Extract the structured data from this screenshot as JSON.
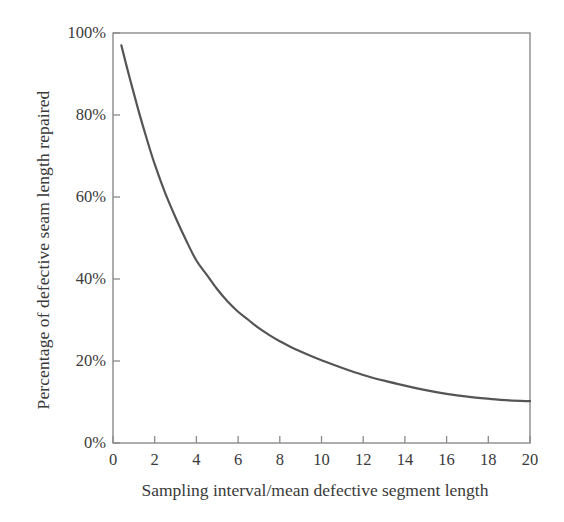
{
  "chart_data": {
    "type": "line",
    "title": "",
    "xlabel": "Sampling interval/mean defective segment length",
    "ylabel": "Percentage of defective seam length repaired",
    "xlim": [
      0,
      20
    ],
    "ylim": [
      0,
      100
    ],
    "grid": false,
    "legend": null,
    "xticks": [
      0,
      2,
      4,
      6,
      8,
      10,
      12,
      14,
      16,
      18,
      20
    ],
    "xtick_labels": [
      "0",
      "2",
      "4",
      "6",
      "8",
      "10",
      "12",
      "14",
      "16",
      "18",
      "20"
    ],
    "yticks": [
      0,
      20,
      40,
      60,
      80,
      100
    ],
    "ytick_labels": [
      "0%",
      "20%",
      "40%",
      "60%",
      "80%",
      "100%"
    ],
    "series": [
      {
        "name": "Percentage of defective seam length repaired",
        "color": "#555555",
        "line_width": 2.2,
        "x": [
          0.4,
          0.8,
          1.2,
          1.6,
          2.0,
          2.5,
          3.0,
          3.5,
          4.0,
          4.5,
          5.0,
          5.5,
          6.0,
          6.5,
          7.0,
          7.5,
          8.0,
          8.5,
          9.0,
          9.5,
          10.0,
          11.0,
          12.0,
          13.0,
          14.0,
          15.0,
          16.0,
          17.0,
          18.0,
          19.0,
          20.0
        ],
        "y": [
          97.0,
          89.0,
          81.5,
          74.5,
          68.0,
          61.0,
          55.0,
          49.5,
          44.5,
          41.0,
          37.5,
          34.5,
          32.0,
          30.0,
          28.0,
          26.3,
          24.8,
          23.5,
          22.3,
          21.2,
          20.2,
          18.3,
          16.6,
          15.2,
          14.0,
          12.9,
          12.0,
          11.3,
          10.8,
          10.4,
          10.2
        ]
      }
    ]
  },
  "axes": {
    "frame_color": "#8a8a8a",
    "tick_color": "#8a8a8a",
    "background": "#ffffff"
  }
}
